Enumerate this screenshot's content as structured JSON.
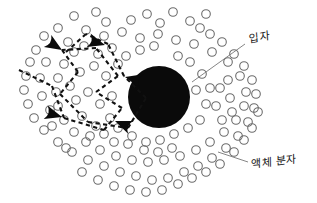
{
  "figure": {
    "background_color": "#ffffff",
    "width": 317,
    "height": 203
  },
  "labels": {
    "particle": "입자",
    "liquid_molecule": "액체 분자"
  },
  "colors": {
    "particle_fill": "#0a0a0a",
    "molecule_stroke": "#6b6b6b",
    "trail_stroke": "#111111",
    "leader_stroke": "#777777",
    "label_text": "#151515"
  },
  "chart_data": {
    "type": "scatter",
    "xlabel": "",
    "ylabel": "",
    "grid": false,
    "legend_position": "none",
    "xlim": [
      0,
      317
    ],
    "ylim": [
      0,
      203
    ],
    "annotations": [
      {
        "name": "particle-label",
        "text": "입자",
        "x": 249,
        "y": 36,
        "leader_from": [
          192,
          82
        ],
        "leader_to": [
          245,
          44
        ]
      },
      {
        "name": "liquid-molecule-label",
        "text": "액체 분자",
        "x": 251,
        "y": 161,
        "leader_from": [
          218,
          152
        ],
        "leader_to": [
          248,
          162
        ]
      }
    ],
    "series": [
      {
        "name": "Brownian particle",
        "type": "marker",
        "marker": "filled-circle",
        "radius": 31,
        "points": [
          [
            159,
            97
          ]
        ]
      },
      {
        "name": "Liquid molecules",
        "type": "marker",
        "marker": "open-circle",
        "radius": 4.3,
        "points": [
          [
            74,
            16
          ],
          [
            96,
            12
          ],
          [
            106,
            22
          ],
          [
            131,
            20
          ],
          [
            147,
            14
          ],
          [
            160,
            23
          ],
          [
            173,
            12
          ],
          [
            190,
            21
          ],
          [
            206,
            14
          ],
          [
            200,
            28
          ],
          [
            58,
            28
          ],
          [
            44,
            36
          ],
          [
            36,
            50
          ],
          [
            30,
            62
          ],
          [
            26,
            76
          ],
          [
            24,
            90
          ],
          [
            28,
            104
          ],
          [
            34,
            118
          ],
          [
            44,
            130
          ],
          [
            58,
            142
          ],
          [
            72,
            152
          ],
          [
            88,
            160
          ],
          [
            104,
            166
          ],
          [
            120,
            172
          ],
          [
            136,
            176
          ],
          [
            152,
            180
          ],
          [
            168,
            178
          ],
          [
            184,
            172
          ],
          [
            198,
            166
          ],
          [
            212,
            158
          ],
          [
            226,
            148
          ],
          [
            238,
            136
          ],
          [
            248,
            122
          ],
          [
            254,
            108
          ],
          [
            256,
            94
          ],
          [
            252,
            80
          ],
          [
            244,
            66
          ],
          [
            234,
            54
          ],
          [
            222,
            42
          ],
          [
            210,
            34
          ],
          [
            86,
            30
          ],
          [
            104,
            36
          ],
          [
            122,
            32
          ],
          [
            140,
            38
          ],
          [
            158,
            34
          ],
          [
            176,
            40
          ],
          [
            194,
            44
          ],
          [
            212,
            52
          ],
          [
            228,
            62
          ],
          [
            240,
            76
          ],
          [
            246,
            92
          ],
          [
            244,
            106
          ],
          [
            236,
            120
          ],
          [
            224,
            132
          ],
          [
            210,
            142
          ],
          [
            196,
            150
          ],
          [
            180,
            156
          ],
          [
            164,
            160
          ],
          [
            148,
            162
          ],
          [
            132,
            160
          ],
          [
            116,
            156
          ],
          [
            100,
            150
          ],
          [
            86,
            142
          ],
          [
            74,
            132
          ],
          [
            64,
            120
          ],
          [
            58,
            106
          ],
          [
            56,
            92
          ],
          [
            58,
            78
          ],
          [
            64,
            64
          ],
          [
            74,
            52
          ],
          [
            68,
            42
          ],
          [
            84,
            46
          ],
          [
            98,
            54
          ],
          [
            112,
            48
          ],
          [
            126,
            56
          ],
          [
            140,
            50
          ],
          [
            154,
            46
          ],
          [
            118,
            64
          ],
          [
            132,
            72
          ],
          [
            106,
            76
          ],
          [
            94,
            66
          ],
          [
            80,
            72
          ],
          [
            70,
            86
          ],
          [
            76,
            100
          ],
          [
            88,
            92
          ],
          [
            100,
            104
          ],
          [
            112,
            96
          ],
          [
            124,
            108
          ],
          [
            110,
            118
          ],
          [
            96,
            126
          ],
          [
            82,
            116
          ],
          [
            90,
            136
          ],
          [
            104,
            134
          ],
          [
            118,
            128
          ],
          [
            132,
            136
          ],
          [
            146,
            142
          ],
          [
            160,
            140
          ],
          [
            174,
            134
          ],
          [
            188,
            128
          ],
          [
            200,
            120
          ],
          [
            206,
            104
          ],
          [
            210,
            88
          ],
          [
            202,
            74
          ],
          [
            190,
            62
          ],
          [
            178,
            56
          ],
          [
            166,
            66
          ],
          [
            196,
            90
          ],
          [
            188,
            104
          ],
          [
            176,
            116
          ],
          [
            164,
            124
          ],
          [
            150,
            128
          ],
          [
            136,
            122
          ],
          [
            142,
            108
          ],
          [
            150,
            116
          ],
          [
            230,
            98
          ],
          [
            232,
            112
          ],
          [
            222,
            120
          ],
          [
            216,
            106
          ],
          [
            220,
            88
          ],
          [
            228,
            80
          ],
          [
            46,
            62
          ],
          [
            40,
            78
          ],
          [
            42,
            96
          ],
          [
            50,
            110
          ],
          [
            52,
            126
          ],
          [
            66,
            148
          ],
          [
            82,
            172
          ],
          [
            98,
            180
          ],
          [
            114,
            186
          ],
          [
            130,
            190
          ],
          [
            146,
            192
          ],
          [
            162,
            190
          ],
          [
            178,
            184
          ],
          [
            192,
            178
          ],
          [
            206,
            172
          ],
          [
            220,
            164
          ],
          [
            234,
            152
          ],
          [
            244,
            140
          ],
          [
            252,
            128
          ],
          [
            258,
            112
          ],
          [
            172,
            148
          ],
          [
            158,
            152
          ],
          [
            144,
            150
          ],
          [
            128,
            144
          ],
          [
            114,
            142
          ]
        ]
      }
    ],
    "path": {
      "name": "Brownian trajectory",
      "style": "dashed",
      "vertices": [
        [
          19,
          70
        ],
        [
          52,
          86
        ],
        [
          64,
          118
        ],
        [
          104,
          130
        ],
        [
          122,
          108
        ],
        [
          96,
          92
        ],
        [
          118,
          76
        ],
        [
          96,
          48
        ],
        [
          62,
          50
        ],
        [
          78,
          72
        ],
        [
          60,
          94
        ],
        [
          88,
          122
        ],
        [
          128,
          128
        ],
        [
          146,
          98
        ],
        [
          124,
          76
        ],
        [
          108,
          44
        ],
        [
          86,
          34
        ],
        [
          66,
          52
        ]
      ],
      "arrow_heads": [
        {
          "x": 105,
          "y": 45,
          "angle": 196
        },
        {
          "x": 62,
          "y": 50,
          "angle": 212
        },
        {
          "x": 125,
          "y": 77,
          "angle": 14
        },
        {
          "x": 62,
          "y": 117,
          "angle": 196
        },
        {
          "x": 115,
          "y": 121,
          "angle": 22
        }
      ]
    }
  }
}
